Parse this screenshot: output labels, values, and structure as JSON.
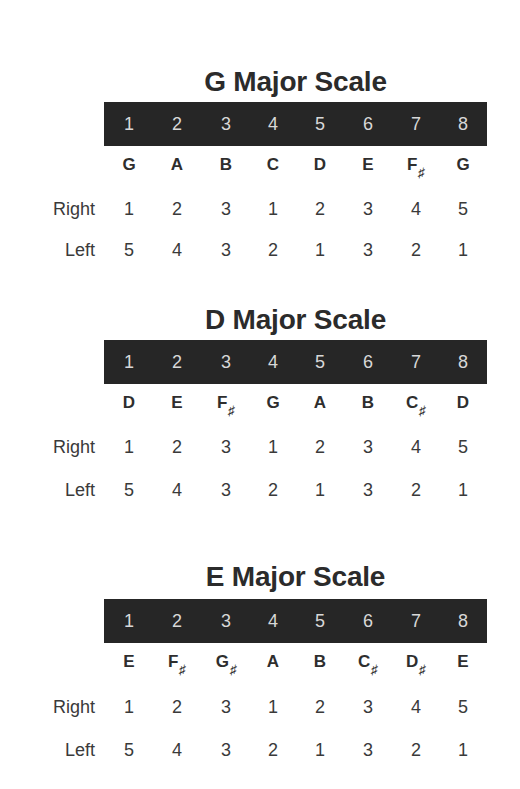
{
  "columns": [
    "1",
    "2",
    "3",
    "4",
    "5",
    "6",
    "7",
    "8"
  ],
  "row_labels": {
    "right": "Right",
    "left": "Left"
  },
  "sharp_symbol": "♯",
  "scales": [
    {
      "title": "G Major Scale",
      "notes": [
        {
          "letter": "G",
          "accidental": ""
        },
        {
          "letter": "A",
          "accidental": ""
        },
        {
          "letter": "B",
          "accidental": ""
        },
        {
          "letter": "C",
          "accidental": ""
        },
        {
          "letter": "D",
          "accidental": ""
        },
        {
          "letter": "E",
          "accidental": ""
        },
        {
          "letter": "F",
          "accidental": "♯"
        },
        {
          "letter": "G",
          "accidental": ""
        }
      ],
      "right": [
        "1",
        "2",
        "3",
        "1",
        "2",
        "3",
        "4",
        "5"
      ],
      "left": [
        "5",
        "4",
        "3",
        "2",
        "1",
        "3",
        "2",
        "1"
      ]
    },
    {
      "title": "D Major Scale",
      "notes": [
        {
          "letter": "D",
          "accidental": ""
        },
        {
          "letter": "E",
          "accidental": ""
        },
        {
          "letter": "F",
          "accidental": "♯"
        },
        {
          "letter": "G",
          "accidental": ""
        },
        {
          "letter": "A",
          "accidental": ""
        },
        {
          "letter": "B",
          "accidental": ""
        },
        {
          "letter": "C",
          "accidental": "♯"
        },
        {
          "letter": "D",
          "accidental": ""
        }
      ],
      "right": [
        "1",
        "2",
        "3",
        "1",
        "2",
        "3",
        "4",
        "5"
      ],
      "left": [
        "5",
        "4",
        "3",
        "2",
        "1",
        "3",
        "2",
        "1"
      ]
    },
    {
      "title": "E Major Scale",
      "notes": [
        {
          "letter": "E",
          "accidental": ""
        },
        {
          "letter": "F",
          "accidental": "♯"
        },
        {
          "letter": "G",
          "accidental": "♯"
        },
        {
          "letter": "A",
          "accidental": ""
        },
        {
          "letter": "B",
          "accidental": ""
        },
        {
          "letter": "C",
          "accidental": "♯"
        },
        {
          "letter": "D",
          "accidental": "♯"
        },
        {
          "letter": "E",
          "accidental": ""
        }
      ],
      "right": [
        "1",
        "2",
        "3",
        "1",
        "2",
        "3",
        "4",
        "5"
      ],
      "left": [
        "5",
        "4",
        "3",
        "2",
        "1",
        "3",
        "2",
        "1"
      ]
    }
  ],
  "colors": {
    "bar_bg": "#262626",
    "bar_text": "#d8d8d8",
    "text": "#2e2e2e"
  }
}
